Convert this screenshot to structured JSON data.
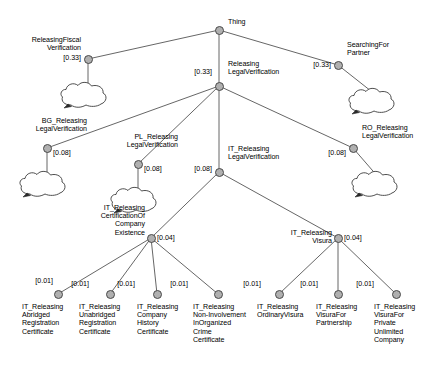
{
  "diagram": {
    "title": "Thing",
    "type": "taxonomy-tree",
    "background_color": "#ffffff",
    "node_fill_color": "#b0b0b0",
    "node_stroke_color": "#4a4a4a",
    "edge_color": "#555555",
    "nodes": [
      {
        "id": "thing",
        "label": "Thing",
        "weight": "",
        "x": 219,
        "y": 30,
        "label_x": 228,
        "label_y": 18,
        "label_align": "right",
        "weight_x": 0,
        "weight_y": 0,
        "weight_align": "right",
        "has_cloud": false,
        "cloud_x": 0,
        "cloud_y": 0
      },
      {
        "id": "releasing-fiscal-verification",
        "label": "ReleasingFiscal\nVerification",
        "weight": "[0.33]",
        "x": 88,
        "y": 59,
        "label_x": 81,
        "label_y": 36,
        "label_align": "left",
        "weight_x": 81,
        "weight_y": 54,
        "weight_align": "left",
        "has_cloud": true,
        "cloud_x": 58,
        "cloud_y": 79
      },
      {
        "id": "releasing-legal-verification",
        "label": "Releasing\nLegalVerification",
        "weight": "[0.33]",
        "x": 219,
        "y": 86,
        "label_x": 228,
        "label_y": 60,
        "label_align": "right",
        "weight_x": 212,
        "weight_y": 68,
        "weight_align": "left",
        "has_cloud": false,
        "cloud_x": 0,
        "cloud_y": 0
      },
      {
        "id": "searching-for-partner",
        "label": "SearchingFor\nPartner",
        "weight": "[0.33]",
        "x": 338,
        "y": 65,
        "label_x": 347,
        "label_y": 41,
        "label_align": "right",
        "weight_x": 331,
        "weight_y": 61,
        "weight_align": "left",
        "has_cloud": true,
        "cloud_x": 346,
        "cloud_y": 85
      },
      {
        "id": "bg-releasing-legal-verification",
        "label": "BG_Releasing\nLegalVerification",
        "weight": "[0.08]",
        "x": 47,
        "y": 148,
        "label_x": 87,
        "label_y": 117,
        "label_align": "left",
        "weight_x": 53,
        "weight_y": 149,
        "weight_align": "right",
        "has_cloud": true,
        "cloud_x": 17,
        "cloud_y": 168
      },
      {
        "id": "pl-releasing-legal-verification",
        "label": "PL_Releasing\nLegalVerification",
        "weight": "[0.08]",
        "x": 138,
        "y": 164,
        "label_x": 178,
        "label_y": 133,
        "label_align": "left",
        "weight_x": 144,
        "weight_y": 165,
        "weight_align": "right",
        "has_cloud": true,
        "cloud_x": 108,
        "cloud_y": 184
      },
      {
        "id": "it-releasing-legal-verification",
        "label": "IT_Releasing\nLegalVerification",
        "weight": "[0.08]",
        "x": 219,
        "y": 172,
        "label_x": 228,
        "label_y": 145,
        "label_align": "right",
        "weight_x": 212,
        "weight_y": 165,
        "weight_align": "left",
        "has_cloud": false,
        "cloud_x": 0,
        "cloud_y": 0
      },
      {
        "id": "ro-releasing-legal-verification",
        "label": "RO_Releasing\nLegalVerification",
        "weight": "[0.08]",
        "x": 353,
        "y": 148,
        "label_x": 362,
        "label_y": 124,
        "label_align": "right",
        "weight_x": 346,
        "weight_y": 149,
        "weight_align": "left",
        "has_cloud": true,
        "cloud_x": 349,
        "cloud_y": 168
      },
      {
        "id": "it-releasing-certification-of-company-existence",
        "label": "IT_Releasing\nCertificationOf\nCompany\nExistence",
        "weight": "[0.04]",
        "x": 151,
        "y": 238,
        "label_x": 145,
        "label_y": 204,
        "label_align": "left",
        "weight_x": 157,
        "weight_y": 234,
        "weight_align": "right",
        "has_cloud": false,
        "cloud_x": 0,
        "cloud_y": 0
      },
      {
        "id": "it-releasing-visura",
        "label": "IT_Releasing\nVisura",
        "weight": "[0.04]",
        "x": 338,
        "y": 238,
        "label_x": 332,
        "label_y": 229,
        "label_align": "left",
        "weight_x": 344,
        "weight_y": 234,
        "weight_align": "right",
        "has_cloud": false,
        "cloud_x": 0,
        "cloud_y": 0
      },
      {
        "id": "it-releasing-abridged-registration-certificate",
        "label": "IT_Releasing\nAbridged\nRegistration\nCertificate",
        "weight": "[0.01]",
        "x": 58,
        "y": 294,
        "label_x": 22,
        "label_y": 303,
        "label_align": "right",
        "weight_x": 53,
        "weight_y": 277,
        "weight_align": "left",
        "has_cloud": false,
        "cloud_x": 0,
        "cloud_y": 0
      },
      {
        "id": "it-releasing-unabridged-registration-certificate",
        "label": "IT_Releasing\nUnabridged\nRegistration\nCertificate",
        "weight": "[0.01]",
        "x": 110,
        "y": 294,
        "label_x": 79,
        "label_y": 303,
        "label_align": "right",
        "weight_x": 89,
        "weight_y": 280,
        "weight_align": "left",
        "has_cloud": false,
        "cloud_x": 0,
        "cloud_y": 0
      },
      {
        "id": "it-releasing-company-history-certificate",
        "label": "IT_Releasing\nCompany\nHistory\nCertificate",
        "weight": "[0.01]",
        "x": 157,
        "y": 294,
        "label_x": 137,
        "label_y": 303,
        "label_align": "right",
        "weight_x": 135,
        "weight_y": 280,
        "weight_align": "left",
        "has_cloud": false,
        "cloud_x": 0,
        "cloud_y": 0
      },
      {
        "id": "it-releasing-non-involvement-in-organized-crime-certificate",
        "label": "IT_Releasing\nNon-Involvement\nInOrganized\nCrime\nCertificate",
        "weight": "[0.01]",
        "x": 218,
        "y": 294,
        "label_x": 193,
        "label_y": 303,
        "label_align": "right",
        "weight_x": 188,
        "weight_y": 280,
        "weight_align": "left",
        "has_cloud": false,
        "cloud_x": 0,
        "cloud_y": 0
      },
      {
        "id": "it-releasing-ordinary-visura",
        "label": "IT_Releasing\nOrdinaryVisura",
        "weight": "[0.01]",
        "x": 279,
        "y": 294,
        "label_x": 257,
        "label_y": 303,
        "label_align": "right",
        "weight_x": 261,
        "weight_y": 280,
        "weight_align": "left",
        "has_cloud": false,
        "cloud_x": 0,
        "cloud_y": 0
      },
      {
        "id": "it-releasing-visura-for-partnership",
        "label": "IT_Releasing\nVisuraFor\nPartnership",
        "weight": "[0.01]",
        "x": 338,
        "y": 294,
        "label_x": 316,
        "label_y": 303,
        "label_align": "right",
        "weight_x": 318,
        "weight_y": 280,
        "weight_align": "left",
        "has_cloud": false,
        "cloud_x": 0,
        "cloud_y": 0
      },
      {
        "id": "it-releasing-visura-for-private-unlimited-company",
        "label": "IT_Releasing\nVisuraFor\nPrivate\nUnlimited\nCompany",
        "weight": "[0.01]",
        "x": 396,
        "y": 294,
        "label_x": 374,
        "label_y": 303,
        "label_align": "right",
        "weight_x": 374,
        "weight_y": 280,
        "weight_align": "left",
        "has_cloud": false,
        "cloud_x": 0,
        "cloud_y": 0
      }
    ],
    "edges": [
      {
        "from": "thing",
        "to": "releasing-fiscal-verification"
      },
      {
        "from": "thing",
        "to": "releasing-legal-verification"
      },
      {
        "from": "thing",
        "to": "searching-for-partner"
      },
      {
        "from": "releasing-legal-verification",
        "to": "bg-releasing-legal-verification"
      },
      {
        "from": "releasing-legal-verification",
        "to": "pl-releasing-legal-verification"
      },
      {
        "from": "releasing-legal-verification",
        "to": "it-releasing-legal-verification"
      },
      {
        "from": "releasing-legal-verification",
        "to": "ro-releasing-legal-verification"
      },
      {
        "from": "it-releasing-legal-verification",
        "to": "it-releasing-certification-of-company-existence"
      },
      {
        "from": "it-releasing-legal-verification",
        "to": "it-releasing-visura"
      },
      {
        "from": "it-releasing-certification-of-company-existence",
        "to": "it-releasing-abridged-registration-certificate"
      },
      {
        "from": "it-releasing-certification-of-company-existence",
        "to": "it-releasing-unabridged-registration-certificate"
      },
      {
        "from": "it-releasing-certification-of-company-existence",
        "to": "it-releasing-company-history-certificate"
      },
      {
        "from": "it-releasing-certification-of-company-existence",
        "to": "it-releasing-non-involvement-in-organized-crime-certificate"
      },
      {
        "from": "it-releasing-visura",
        "to": "it-releasing-ordinary-visura"
      },
      {
        "from": "it-releasing-visura",
        "to": "it-releasing-visura-for-partnership"
      },
      {
        "from": "it-releasing-visura",
        "to": "it-releasing-visura-for-private-unlimited-company"
      }
    ]
  }
}
